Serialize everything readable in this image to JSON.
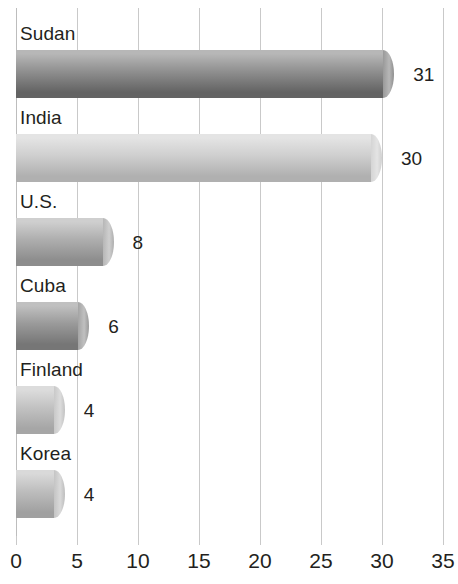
{
  "chart_data": {
    "type": "bar",
    "orientation": "horizontal",
    "title": "",
    "subtitle": "",
    "xlabel": "",
    "ylabel": "",
    "xlim": [
      0,
      35
    ],
    "xticks": [
      "0",
      "5",
      "10",
      "15",
      "20",
      "25",
      "30",
      "35"
    ],
    "grid": "vertical",
    "legend": "none",
    "categories": [
      "Sudan",
      "India",
      "U.S.",
      "Cuba",
      "Finland",
      "Korea"
    ],
    "values": [
      31,
      30,
      8,
      6,
      4,
      4
    ],
    "value_labels": [
      "31",
      "30",
      "8",
      "6",
      "4",
      "4"
    ],
    "bars": [
      {
        "label": "Sudan",
        "value": 31,
        "value_label": "31",
        "color_top": "#b7b7b7",
        "color_mid": "#8f8f8f",
        "color_bottom": "#636363"
      },
      {
        "label": "India",
        "value": 30,
        "value_label": "30",
        "color_top": "#e4e4e4",
        "color_mid": "#cfcfcf",
        "color_bottom": "#b0b0b0"
      },
      {
        "label": "U.S.",
        "value": 8,
        "value_label": "8",
        "color_top": "#cfcfcf",
        "color_mid": "#aeaeae",
        "color_bottom": "#8d8d8d"
      },
      {
        "label": "Cuba",
        "value": 6,
        "value_label": "6",
        "color_top": "#c0c0c0",
        "color_mid": "#9a9a9a",
        "color_bottom": "#767676"
      },
      {
        "label": "Finland",
        "value": 4,
        "value_label": "4",
        "color_top": "#dcdcdc",
        "color_mid": "#c2c2c2",
        "color_bottom": "#a6a6a6"
      },
      {
        "label": "Korea",
        "value": 4,
        "value_label": "4",
        "color_top": "#d9d9d9",
        "color_mid": "#bdbdbd",
        "color_bottom": "#a0a0a0"
      }
    ],
    "colors": {
      "gridline": "#c9c9c9",
      "text": "#231f20",
      "background": "#ffffff"
    }
  }
}
